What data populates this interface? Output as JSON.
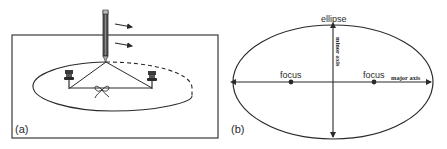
{
  "panel_a": {
    "label": "(a)",
    "description": "Drawing an ellipse with a pencil, string and two pins"
  },
  "panel_b": {
    "label": "(b)",
    "ellipse_label": "ellipse",
    "minor_axis_label": "minor axis",
    "major_axis_label": "major axis",
    "focus_left_label": "focus",
    "focus_right_label": "focus"
  },
  "colors": {
    "stroke": "#2a2a2a",
    "background": "#ffffff"
  }
}
